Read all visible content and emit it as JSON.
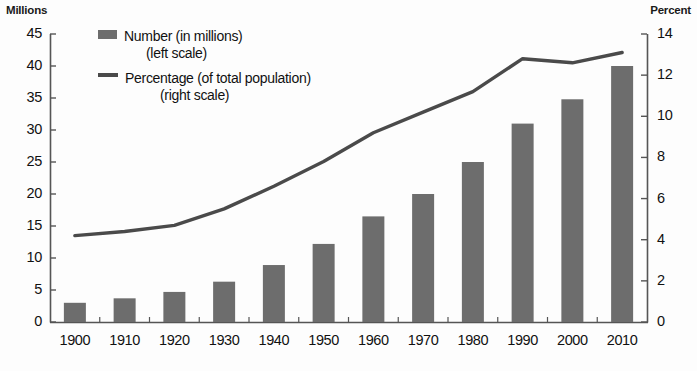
{
  "chart_data": {
    "type": "bar",
    "title": "",
    "categories": [
      "1900",
      "1910",
      "1920",
      "1930",
      "1940",
      "1950",
      "1960",
      "1970",
      "1980",
      "1990",
      "2000",
      "2010"
    ],
    "xlabel": "",
    "grid": false,
    "legend_position": "top-left",
    "series": [
      {
        "name": "Number (in millions)",
        "type": "bar",
        "axis": "left",
        "color": "#6d6d6d",
        "values": [
          3.0,
          3.7,
          4.7,
          6.3,
          8.9,
          12.2,
          16.5,
          20.0,
          25.0,
          31.0,
          34.8,
          40.0
        ]
      },
      {
        "name": "Percentage (of total population)",
        "type": "line",
        "axis": "right",
        "color": "#4a4a4a",
        "values": [
          4.2,
          4.4,
          4.7,
          5.5,
          6.6,
          7.8,
          9.2,
          10.2,
          11.2,
          12.8,
          12.6,
          13.1
        ]
      }
    ],
    "y_left": {
      "label": "Millions",
      "ticks": [
        0,
        5,
        10,
        15,
        20,
        25,
        30,
        35,
        40,
        45
      ],
      "ylim": [
        0,
        45
      ]
    },
    "y_right": {
      "label": "Percent",
      "ticks": [
        0,
        2,
        4,
        6,
        8,
        10,
        12,
        14
      ],
      "ylim": [
        0,
        14
      ]
    }
  },
  "legend": {
    "bar_label": "Number (in millions)",
    "bar_sub": "(left scale)",
    "line_label": "Percentage (of total population)",
    "line_sub": "(right scale)"
  },
  "axes": {
    "left_title": "Millions",
    "right_title": "Percent"
  }
}
